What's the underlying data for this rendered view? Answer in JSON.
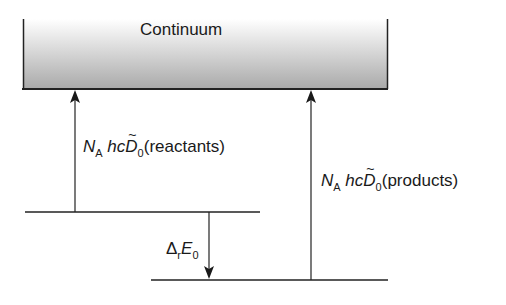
{
  "diagram": {
    "continuum": {
      "label": "Continuum",
      "gradient_top": "#ffffff",
      "gradient_bottom": "#a9a9a9",
      "border_color": "#222222"
    },
    "levels": [
      {
        "name": "reactants",
        "y": 212,
        "x1": 25,
        "x2": 260
      },
      {
        "name": "products",
        "y": 280,
        "x1": 151,
        "x2": 388
      }
    ],
    "arrows": [
      {
        "name": "dissociation-reactants",
        "direction": "up",
        "x": 75,
        "from_y": 212,
        "to_y": 89
      },
      {
        "name": "dissociation-products",
        "direction": "up",
        "x": 311,
        "from_y": 280,
        "to_y": 89
      },
      {
        "name": "reaction-energy",
        "direction": "down",
        "x": 209,
        "from_y": 212,
        "to_y": 280
      }
    ],
    "labels": {
      "reactants": {
        "N": "N",
        "N_sub": "A",
        "hc": "hc",
        "D": "D",
        "D_sub": "0",
        "tail": "(reactants)"
      },
      "products": {
        "N": "N",
        "N_sub": "A",
        "hc": "hc",
        "D": "D",
        "D_sub": "0",
        "tail": "(products)"
      },
      "delta": {
        "symbol": "Δ",
        "symbol_sub": "r",
        "E": "E",
        "E_sub": "0"
      }
    }
  }
}
